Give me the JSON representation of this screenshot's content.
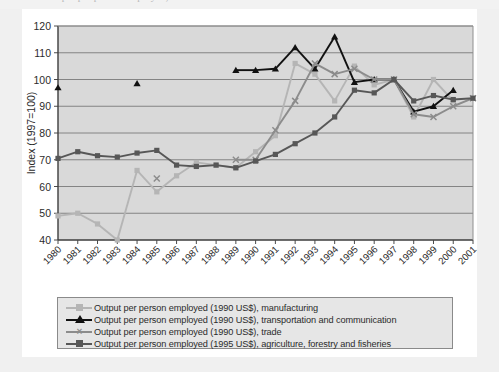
{
  "title_fragment": "Output per person employed, selected sectors",
  "chart_data": {
    "type": "line",
    "title": "",
    "xlabel": "",
    "ylabel": "Index (1997=100)",
    "ylim": [
      40,
      120
    ],
    "ytick_step": 10,
    "yticks": [
      40,
      50,
      60,
      70,
      80,
      90,
      100,
      110,
      120
    ],
    "grid": "horizontal",
    "legend_position": "bottom",
    "x": [
      1980,
      1981,
      1982,
      1983,
      1984,
      1985,
      1986,
      1987,
      1988,
      1989,
      1990,
      1991,
      1992,
      1993,
      1994,
      1995,
      1996,
      1997,
      1998,
      1999,
      2000,
      2001
    ],
    "series": [
      {
        "name": "Output per person employed (1990 US$), manufacturing",
        "color": "#b5b5b5",
        "marker": "square",
        "values": [
          49,
          50,
          46,
          40,
          66,
          58,
          64,
          69,
          68,
          67,
          73,
          79,
          106,
          102,
          92,
          105,
          98,
          100,
          86,
          100,
          92,
          null
        ]
      },
      {
        "name": "Output per person employed (1990 US$), transportation and communication",
        "color": "#111111",
        "marker": "triangle",
        "values": [
          97,
          null,
          null,
          null,
          98.5,
          null,
          null,
          null,
          null,
          103.5,
          103.5,
          104,
          112,
          104,
          116,
          99,
          100,
          100,
          88,
          90,
          96,
          null
        ]
      },
      {
        "name": "Output per person employed (1990 US$), trade",
        "color": "#8c8c8c",
        "marker": "x",
        "values": [
          null,
          null,
          null,
          null,
          null,
          63,
          null,
          null,
          null,
          70,
          70,
          81,
          92,
          106,
          102,
          104,
          100,
          100,
          87,
          86,
          90,
          93
        ]
      },
      {
        "name": "Output per person employed (1995 US$), agriculture, forestry and fisheries",
        "color": "#575757",
        "marker": "square",
        "values": [
          70.5,
          73,
          71.5,
          71,
          72.5,
          73.5,
          68,
          67.5,
          68,
          67,
          69.5,
          72,
          76,
          80,
          86,
          96,
          95,
          100,
          92,
          94,
          92.5,
          93
        ]
      }
    ]
  },
  "legend": {
    "items": [
      {
        "label": "Output per person employed (1990 US$), manufacturing",
        "color": "#b5b5b5",
        "marker": "square"
      },
      {
        "label": "Output per person employed (1990 US$), transportation and communication",
        "color": "#111111",
        "marker": "triangle"
      },
      {
        "label": "Output per person employed (1990 US$), trade",
        "color": "#8c8c8c",
        "marker": "x"
      },
      {
        "label": "Output per person employed (1995 US$), agriculture, forestry and fisheries",
        "color": "#575757",
        "marker": "square"
      }
    ]
  },
  "axis": {
    "y_title": "Index (1997=100)",
    "y_labels": [
      "120",
      "110",
      "100",
      "90",
      "80",
      "70",
      "60",
      "50",
      "40"
    ],
    "x_labels": [
      "1980",
      "1981",
      "1982",
      "1983",
      "1984",
      "1985",
      "1986",
      "1987",
      "1988",
      "1989",
      "1990",
      "1991",
      "1992",
      "1993",
      "1994",
      "1995",
      "1996",
      "1997",
      "1998",
      "1999",
      "2000",
      "2001"
    ]
  },
  "colors": {
    "plot_area": "#d9d9d9",
    "grid": "#7a7a7a",
    "axis": "#4a4a4a",
    "card": "#ffffff",
    "page": "#f0f0f0"
  }
}
